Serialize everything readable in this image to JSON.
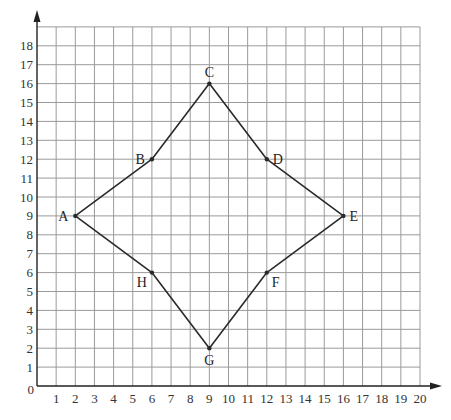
{
  "diagram": {
    "type": "coordinate-grid-polygon",
    "origin_label": "0",
    "x_axis": {
      "min": 0,
      "max": 20,
      "ticks": [
        1,
        2,
        3,
        4,
        5,
        6,
        7,
        8,
        9,
        10,
        11,
        12,
        13,
        14,
        15,
        16,
        17,
        18,
        19,
        20
      ]
    },
    "y_axis": {
      "min": 0,
      "max": 19,
      "ticks": [
        1,
        2,
        3,
        4,
        5,
        6,
        7,
        8,
        9,
        10,
        11,
        12,
        13,
        14,
        15,
        16,
        17,
        18
      ]
    },
    "points": [
      {
        "label": "A",
        "x": 2,
        "y": 9,
        "label_pos": "left"
      },
      {
        "label": "B",
        "x": 6,
        "y": 12,
        "label_pos": "left"
      },
      {
        "label": "C",
        "x": 9,
        "y": 16,
        "label_pos": "above"
      },
      {
        "label": "D",
        "x": 12,
        "y": 12,
        "label_pos": "right"
      },
      {
        "label": "E",
        "x": 16,
        "y": 9,
        "label_pos": "right"
      },
      {
        "label": "F",
        "x": 12,
        "y": 6,
        "label_pos": "below-right"
      },
      {
        "label": "G",
        "x": 9,
        "y": 2,
        "label_pos": "below"
      },
      {
        "label": "H",
        "x": 6,
        "y": 6,
        "label_pos": "below-left"
      }
    ],
    "polygon_order": [
      "A",
      "B",
      "C",
      "D",
      "E",
      "F",
      "G",
      "H"
    ],
    "colors": {
      "grid": "#9a9a9a",
      "axis": "#222222",
      "shape": "#2a2a2a"
    }
  }
}
